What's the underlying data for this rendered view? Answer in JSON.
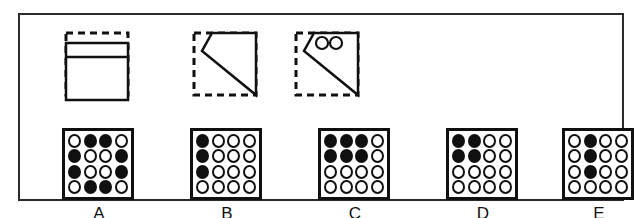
{
  "frame": {
    "border_color": "#2b2b2b",
    "background": "#ffffff"
  },
  "palette": {
    "ink": "#101010",
    "fill": "#101010",
    "empty": "#ffffff"
  },
  "stimuli": [
    {
      "id": "stimulus-1",
      "name": "dashed-square-with-split-rectangle",
      "dashed_box": true,
      "description": "dashed square outline with a solid rectangle inside divided by a horizontal line near the top",
      "left": 60,
      "circles": 0
    },
    {
      "id": "stimulus-2",
      "name": "dashed-square-with-diagonal-polygon",
      "dashed_box": true,
      "description": "dashed square outline with a solid polygon having a diagonal edge from upper-left to lower-right",
      "left": 188,
      "circles": 0
    },
    {
      "id": "stimulus-3",
      "name": "dashed-square-with-diagonal-polygon-and-two-circles",
      "dashed_box": true,
      "description": "same polygon as the second figure with two small circles in its upper-left corner",
      "left": 290,
      "circles": 2
    }
  ],
  "options": [
    {
      "label": "A",
      "left": 60,
      "grid": [
        [
          0,
          1,
          1,
          0
        ],
        [
          1,
          0,
          0,
          1
        ],
        [
          1,
          0,
          0,
          1
        ],
        [
          0,
          1,
          1,
          0
        ]
      ]
    },
    {
      "label": "B",
      "left": 188,
      "grid": [
        [
          1,
          0,
          0,
          0
        ],
        [
          1,
          0,
          0,
          0
        ],
        [
          1,
          0,
          0,
          0
        ],
        [
          0,
          0,
          0,
          0
        ]
      ]
    },
    {
      "label": "C",
      "left": 316,
      "grid": [
        [
          1,
          1,
          1,
          0
        ],
        [
          1,
          1,
          1,
          0
        ],
        [
          0,
          0,
          0,
          0
        ],
        [
          0,
          0,
          0,
          0
        ]
      ]
    },
    {
      "label": "D",
      "left": 444,
      "grid": [
        [
          1,
          1,
          0,
          0
        ],
        [
          1,
          1,
          0,
          0
        ],
        [
          0,
          0,
          0,
          0
        ],
        [
          0,
          0,
          0,
          0
        ]
      ]
    },
    {
      "label": "E",
      "left": 560,
      "grid": [
        [
          0,
          1,
          0,
          0
        ],
        [
          0,
          1,
          0,
          0
        ],
        [
          0,
          1,
          0,
          0
        ],
        [
          0,
          0,
          0,
          0
        ]
      ]
    }
  ]
}
